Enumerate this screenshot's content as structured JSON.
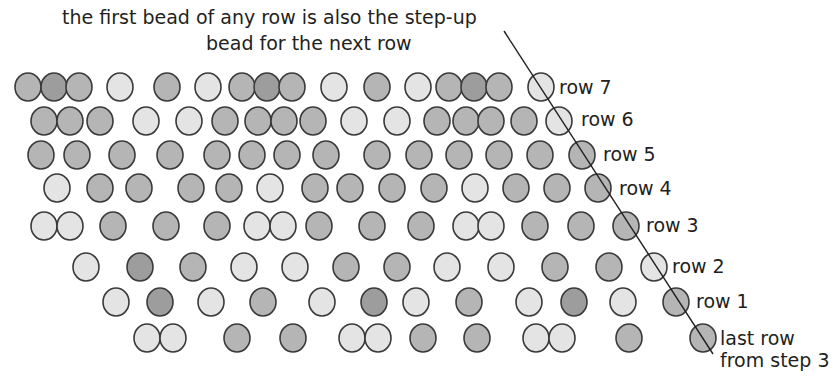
{
  "caption": {
    "line1": "the first bead of any row is also the step-up",
    "line2": "bead for the next row"
  },
  "colors": {
    "light": "#e4e4e4",
    "mid": "#b5b5b5",
    "dark": "#9d9d9d",
    "outline": "#3a3a3a",
    "line": "#231f20"
  },
  "bead_radius": 13,
  "step_up_line": {
    "x1": 504,
    "y1": 31,
    "x2": 713,
    "y2": 354
  },
  "rows": [
    {
      "label": "row 7",
      "y": 87,
      "label_x": 559,
      "label_y": 76,
      "beads": [
        [
          28,
          "mid"
        ],
        [
          54,
          "dark"
        ],
        [
          79,
          "mid"
        ],
        [
          120,
          "light"
        ],
        [
          167,
          "mid"
        ],
        [
          208,
          "light"
        ],
        [
          242,
          "mid"
        ],
        [
          267,
          "dark"
        ],
        [
          292,
          "mid"
        ],
        [
          334,
          "light"
        ],
        [
          377,
          "mid"
        ],
        [
          418,
          "light"
        ],
        [
          449,
          "mid"
        ],
        [
          474,
          "dark"
        ],
        [
          499,
          "mid"
        ],
        [
          541,
          "light"
        ]
      ]
    },
    {
      "label": "row 6",
      "y": 121,
      "label_x": 581,
      "label_y": 108,
      "beads": [
        [
          44,
          "mid"
        ],
        [
          70,
          "mid"
        ],
        [
          100,
          "mid"
        ],
        [
          146,
          "light"
        ],
        [
          189,
          "light"
        ],
        [
          225,
          "mid"
        ],
        [
          258,
          "mid"
        ],
        [
          284,
          "mid"
        ],
        [
          313,
          "mid"
        ],
        [
          354,
          "light"
        ],
        [
          397,
          "light"
        ],
        [
          437,
          "mid"
        ],
        [
          466,
          "mid"
        ],
        [
          491,
          "mid"
        ],
        [
          524,
          "mid"
        ],
        [
          559,
          "light"
        ]
      ]
    },
    {
      "label": "row 5",
      "y": 155,
      "label_x": 603,
      "label_y": 143,
      "beads": [
        [
          41,
          "mid"
        ],
        [
          77,
          "mid"
        ],
        [
          122,
          "mid"
        ],
        [
          170,
          "mid"
        ],
        [
          217,
          "mid"
        ],
        [
          252,
          "mid"
        ],
        [
          287,
          "mid"
        ],
        [
          326,
          "mid"
        ],
        [
          377,
          "mid"
        ],
        [
          419,
          "mid"
        ],
        [
          459,
          "mid"
        ],
        [
          499,
          "mid"
        ],
        [
          540,
          "mid"
        ],
        [
          582,
          "mid"
        ]
      ]
    },
    {
      "label": "row 4",
      "y": 188,
      "label_x": 619,
      "label_y": 177,
      "beads": [
        [
          57,
          "light"
        ],
        [
          100,
          "mid"
        ],
        [
          139,
          "mid"
        ],
        [
          191,
          "mid"
        ],
        [
          229,
          "mid"
        ],
        [
          270,
          "light"
        ],
        [
          315,
          "mid"
        ],
        [
          350,
          "mid"
        ],
        [
          392,
          "mid"
        ],
        [
          434,
          "mid"
        ],
        [
          475,
          "light"
        ],
        [
          516,
          "mid"
        ],
        [
          557,
          "mid"
        ],
        [
          598,
          "mid"
        ]
      ]
    },
    {
      "label": "row 3",
      "y": 226,
      "label_x": 646,
      "label_y": 214,
      "beads": [
        [
          44,
          "light"
        ],
        [
          70,
          "light"
        ],
        [
          113,
          "mid"
        ],
        [
          166,
          "mid"
        ],
        [
          217,
          "mid"
        ],
        [
          257,
          "light"
        ],
        [
          283,
          "light"
        ],
        [
          319,
          "mid"
        ],
        [
          372,
          "mid"
        ],
        [
          421,
          "mid"
        ],
        [
          466,
          "light"
        ],
        [
          491,
          "light"
        ],
        [
          535,
          "mid"
        ],
        [
          581,
          "mid"
        ],
        [
          626,
          "mid"
        ]
      ]
    },
    {
      "label": "row 2",
      "y": 267,
      "label_x": 672,
      "label_y": 255,
      "beads": [
        [
          86,
          "light"
        ],
        [
          140,
          "dark"
        ],
        [
          193,
          "mid"
        ],
        [
          244,
          "light"
        ],
        [
          295,
          "light"
        ],
        [
          346,
          "mid"
        ],
        [
          397,
          "mid"
        ],
        [
          447,
          "light"
        ],
        [
          501,
          "light"
        ],
        [
          555,
          "mid"
        ],
        [
          609,
          "mid"
        ],
        [
          654,
          "light"
        ]
      ]
    },
    {
      "label": "row 1",
      "y": 302,
      "label_x": 696,
      "label_y": 290,
      "beads": [
        [
          116,
          "light"
        ],
        [
          160,
          "dark"
        ],
        [
          211,
          "light"
        ],
        [
          263,
          "mid"
        ],
        [
          322,
          "light"
        ],
        [
          374,
          "dark"
        ],
        [
          416,
          "light"
        ],
        [
          469,
          "mid"
        ],
        [
          529,
          "light"
        ],
        [
          574,
          "dark"
        ],
        [
          623,
          "light"
        ],
        [
          676,
          "mid"
        ]
      ]
    },
    {
      "label": "last row",
      "label2": "from step 3",
      "y": 338,
      "label_x": 720,
      "label_y": 327,
      "beads": [
        [
          147,
          "light"
        ],
        [
          173,
          "light"
        ],
        [
          237,
          "mid"
        ],
        [
          293,
          "mid"
        ],
        [
          352,
          "light"
        ],
        [
          378,
          "light"
        ],
        [
          423,
          "mid"
        ],
        [
          477,
          "mid"
        ],
        [
          536,
          "light"
        ],
        [
          562,
          "light"
        ],
        [
          629,
          "mid"
        ],
        [
          703,
          "mid"
        ]
      ]
    }
  ]
}
